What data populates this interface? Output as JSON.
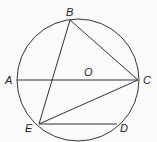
{
  "diagram": {
    "type": "circle-geometry",
    "colors": {
      "line": "#333333",
      "label": "#222222",
      "background": "#fbfbfb"
    },
    "circle": {
      "cx": 78,
      "cy": 80,
      "r": 61,
      "center_label": "O"
    },
    "points": {
      "A": {
        "x": 17,
        "y": 80
      },
      "B": {
        "x": 70,
        "y": 20
      },
      "C": {
        "x": 138,
        "y": 80
      },
      "D": {
        "x": 117,
        "y": 124
      },
      "E": {
        "x": 39,
        "y": 124
      }
    },
    "segments": [
      [
        "A",
        "C"
      ],
      [
        "B",
        "C"
      ],
      [
        "B",
        "E"
      ],
      [
        "E",
        "C"
      ],
      [
        "E",
        "D"
      ]
    ],
    "labels": {
      "A": {
        "text": "A",
        "x": 5,
        "y": 84
      },
      "B": {
        "text": "B",
        "x": 66,
        "y": 16
      },
      "C": {
        "text": "C",
        "x": 143,
        "y": 84
      },
      "D": {
        "text": "D",
        "x": 120,
        "y": 132
      },
      "E": {
        "text": "E",
        "x": 25,
        "y": 132
      },
      "O": {
        "text": "O",
        "x": 84,
        "y": 76
      }
    }
  }
}
